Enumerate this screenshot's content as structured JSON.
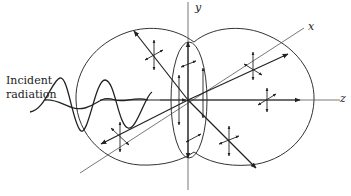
{
  "figure": {
    "caption": "",
    "incident_label_line1": "Incident",
    "incident_label_line2": "radiation",
    "axes": {
      "x_label": "x",
      "y_label": "y",
      "z_label": "z"
    },
    "colors": {
      "ink": "#222222",
      "axis": "#555555",
      "background": "#ffffff"
    }
  }
}
